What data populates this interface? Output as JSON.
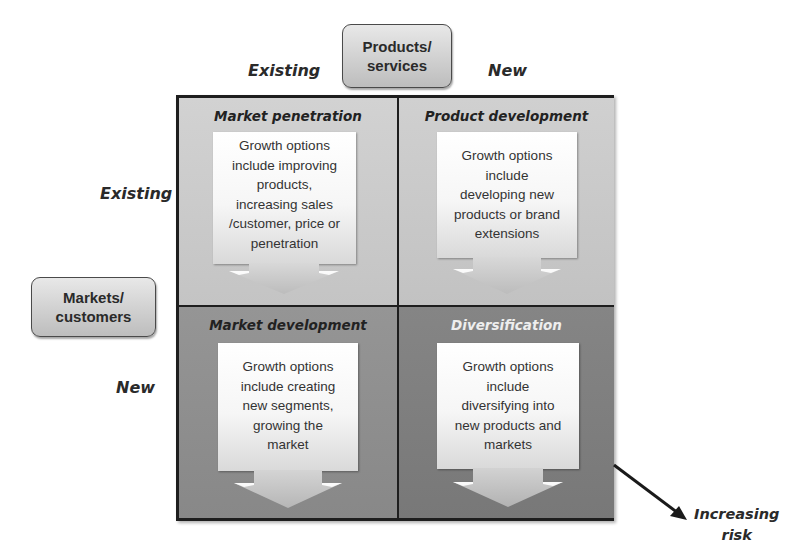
{
  "diagram": {
    "type": "Ansoff matrix",
    "top_axis": {
      "box_label": "Products/ services",
      "left_label": "Existing",
      "right_label": "New"
    },
    "side_axis": {
      "box_label": "Markets/ customers",
      "top_label": "Existing",
      "bottom_label": "New"
    },
    "quadrants": [
      {
        "title": "Market penetration",
        "text": "Growth options include  improving products, increasing sales /customer, price or penetration",
        "lines": [
          "Growth options",
          "include  improving",
          "products,",
          "increasing sales",
          "/customer, price or",
          "penetration"
        ],
        "fill": "#c8c8c8"
      },
      {
        "title": "Product development",
        "text": "Growth options include developing new products or brand extensions",
        "lines": [
          "Growth options",
          "include",
          "developing new",
          "products or brand",
          "extensions"
        ],
        "fill": "#c8c8c8"
      },
      {
        "title": "Market development",
        "text": "Growth options include creating new segments, growing the market",
        "lines": [
          "Growth options",
          "include creating",
          "new segments,",
          "growing the",
          "market"
        ],
        "fill": "#8e8e8e"
      },
      {
        "title": "Diversification",
        "text": "Growth options include diversifying into new products and markets",
        "lines": [
          "Growth options",
          "include",
          "diversifying into",
          "new products and",
          "markets"
        ],
        "fill": "#7e7e7e"
      }
    ],
    "risk_arrow": {
      "label_line1": "Increasing",
      "label_line2": "risk"
    }
  },
  "colors": {
    "border": "#1e1e1e",
    "top_row_fill": "#c8c8c8",
    "bottom_left_fill": "#8e8e8e",
    "bottom_right_fill": "#7e7e7e",
    "diversification_title": "#eeeeee"
  }
}
